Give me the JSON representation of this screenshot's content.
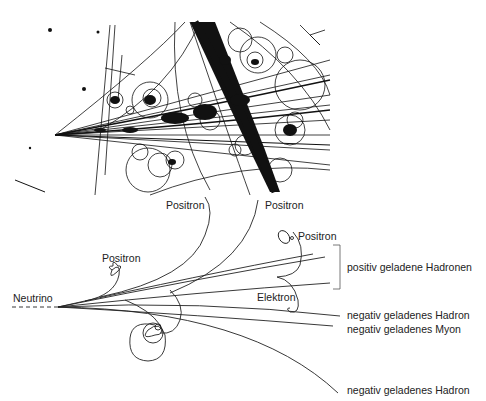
{
  "figure": {
    "photo": {
      "description": "bubble-chamber-photograph",
      "colors": {
        "ink": "#111111",
        "paper": "#ffffff"
      }
    },
    "diagram": {
      "incoming": {
        "label": "Neutrino"
      },
      "tracks": [
        {
          "id": "positron-1",
          "label": "Positron"
        },
        {
          "id": "positron-2",
          "label": "Positron"
        },
        {
          "id": "positron-3",
          "label": "Positron"
        },
        {
          "id": "positron-4",
          "label": "Positron"
        },
        {
          "id": "electron",
          "label": "Elektron"
        },
        {
          "id": "pos-hadrons",
          "label": "positiv geladene Hadronen"
        },
        {
          "id": "neg-hadron-1",
          "label": "negativ geladenes Hadron"
        },
        {
          "id": "neg-muon",
          "label": "negativ geladenes Myon"
        },
        {
          "id": "neg-hadron-2",
          "label": "negativ geladenes Hadron"
        }
      ]
    }
  }
}
